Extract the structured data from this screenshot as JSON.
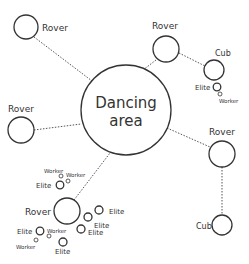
{
  "diagram": {
    "center": {
      "label_line1": "Dancing",
      "label_line2": "area"
    },
    "links_note": "dotted connections from Dancing area to Rovers and from Rovers to Cubs",
    "nodes": {
      "rover_top_left": {
        "label": "Rover"
      },
      "rover_top_right": {
        "label": "Rover"
      },
      "cub_top_right": {
        "label": "Cub"
      },
      "elite_top_right": {
        "label": "Elite"
      },
      "worker_top_right": {
        "label": "Worker"
      },
      "rover_left": {
        "label": "Rover"
      },
      "rover_right": {
        "label": "Rover"
      },
      "cub_bottom_right": {
        "label": "Cub"
      },
      "rover_bottom_left": {
        "label": "Rover"
      },
      "worker_a": {
        "label": "Worker"
      },
      "worker_b": {
        "label": "Worker"
      },
      "elite_a": {
        "label": "Elite"
      },
      "elite_b": {
        "label": "Elite"
      },
      "elite_c": {
        "label": "Elite"
      },
      "elite_d": {
        "label": "Elite"
      },
      "elite_e": {
        "label": "Elite"
      },
      "worker_c": {
        "label": "Worker"
      },
      "worker_d": {
        "label": "Worker"
      },
      "elite_f": {
        "label": "Elite"
      }
    },
    "colors": {
      "stroke": "#333333",
      "link": "#555555",
      "background": "#ffffff"
    }
  }
}
